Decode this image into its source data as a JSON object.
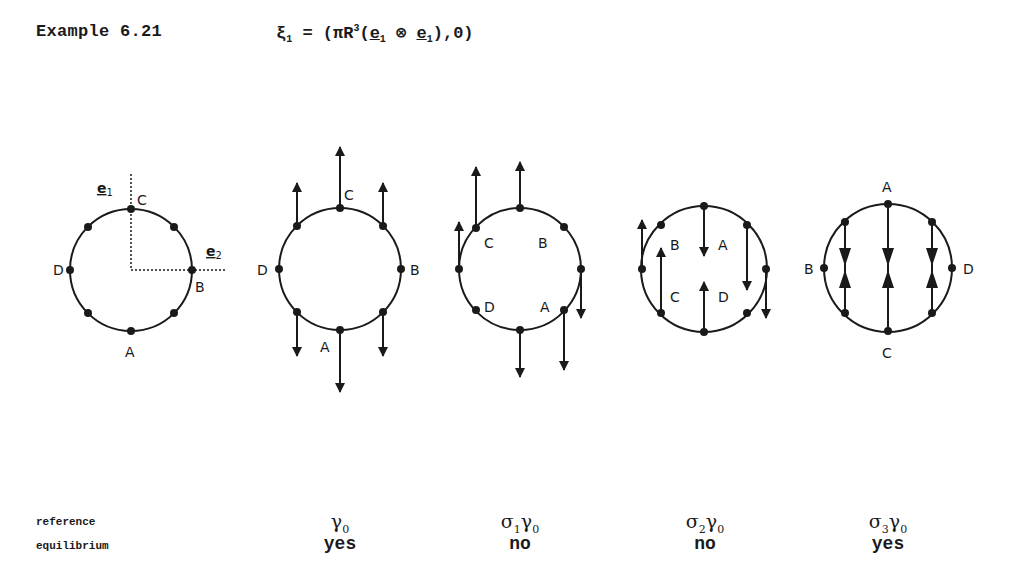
{
  "header": {
    "title": "Example 6.21",
    "formula": {
      "lhs": "ξ",
      "lhs_sub": "1",
      "eq": " = (πR",
      "sup": "3",
      "open": "(",
      "e1": "e",
      "e1_sub": "1",
      "otimes": " ⊗ ",
      "e2": "e",
      "e2_sub": "1",
      "close": "),0)"
    }
  },
  "figure": {
    "axes_diagram": {
      "axis_labels": {
        "e1": "e",
        "e1_sub": "1",
        "e2": "e",
        "e2_sub": "2"
      },
      "points": {
        "top": "C",
        "right": "B",
        "bottom": "A",
        "left": "D"
      }
    },
    "configurations": [
      {
        "id": "gamma0",
        "labels": {
          "top": "C",
          "right": "B",
          "bottom": "A",
          "left": "D"
        }
      },
      {
        "id": "sigma1gamma0",
        "labels": {
          "ul": "C",
          "ur": "B",
          "ll": "D",
          "lr": "A"
        }
      },
      {
        "id": "sigma2gamma0",
        "labels": {
          "ul": "B",
          "ur": "A",
          "ll": "C",
          "lr": "D"
        }
      },
      {
        "id": "sigma3gamma0",
        "labels": {
          "top": "A",
          "right": "D",
          "bottom": "C",
          "left": "B"
        }
      }
    ]
  },
  "table": {
    "row_labels": {
      "reference": "reference",
      "equilibrium": "equilibrium"
    },
    "columns": [
      {
        "sigma": "",
        "sigma_sub": "",
        "gamma": "γ",
        "gamma_sub": "0",
        "equilibrium": "yes",
        "x": 340
      },
      {
        "sigma": "σ",
        "sigma_sub": "1",
        "gamma": "γ",
        "gamma_sub": "0",
        "equilibrium": "no",
        "x": 520
      },
      {
        "sigma": "σ",
        "sigma_sub": "2",
        "gamma": "γ",
        "gamma_sub": "0",
        "equilibrium": "no",
        "x": 705
      },
      {
        "sigma": "σ",
        "sigma_sub": "3",
        "gamma": "γ",
        "gamma_sub": "0",
        "equilibrium": "yes",
        "x": 888
      }
    ]
  }
}
